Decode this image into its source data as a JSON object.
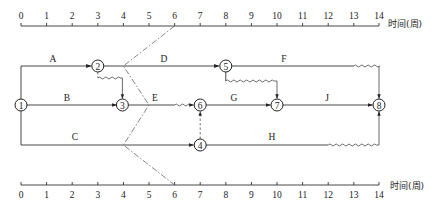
{
  "axis": {
    "unit_label": "时间(周)",
    "ticks": [
      "0",
      "1",
      "2",
      "3",
      "4",
      "5",
      "6",
      "7",
      "8",
      "9",
      "10",
      "11",
      "12",
      "13",
      "14"
    ],
    "min": 0,
    "max": 14
  },
  "nodes": [
    {
      "id": "1",
      "label": "1",
      "week": 0,
      "row": "middle"
    },
    {
      "id": "2",
      "label": "2",
      "week": 3,
      "row": "top"
    },
    {
      "id": "3",
      "label": "3",
      "week": 4,
      "row": "middle"
    },
    {
      "id": "4",
      "label": "4",
      "week": 7,
      "row": "bottom"
    },
    {
      "id": "5",
      "label": "5",
      "week": 8,
      "row": "top"
    },
    {
      "id": "6",
      "label": "6",
      "week": 7,
      "row": "middle"
    },
    {
      "id": "7",
      "label": "7",
      "week": 10,
      "row": "middle"
    },
    {
      "id": "8",
      "label": "8",
      "week": 14,
      "row": "middle"
    }
  ],
  "activities": [
    {
      "name": "A",
      "from": "1",
      "to": "2",
      "start": 0,
      "end": 3,
      "free_float": 0
    },
    {
      "name": "B",
      "from": "1",
      "to": "3",
      "start": 0,
      "end": 4,
      "free_float": 0
    },
    {
      "name": "C",
      "from": "1",
      "to": "4",
      "start": 0,
      "end": 7,
      "free_float": 0
    },
    {
      "name": "D",
      "from": "2",
      "to": "5",
      "start": 3,
      "end": 8,
      "free_float": 0
    },
    {
      "name": "E",
      "from": "3",
      "to": "6",
      "start": 4,
      "end": 6,
      "free_float": 1
    },
    {
      "name": "F",
      "from": "5",
      "to": "8",
      "start": 8,
      "end": 13,
      "free_float": 1
    },
    {
      "name": "G",
      "from": "6",
      "to": "7",
      "start": 7,
      "end": 10,
      "free_float": 0
    },
    {
      "name": "H",
      "from": "4",
      "to": "8",
      "start": 7,
      "end": 12,
      "free_float": 2
    },
    {
      "name": "J",
      "from": "7",
      "to": "8",
      "start": 10,
      "end": 14,
      "free_float": 0
    }
  ],
  "dummies": [
    {
      "from": "2",
      "to": "3",
      "wavy_weeks": [
        3,
        4
      ]
    },
    {
      "from": "5",
      "to": "7",
      "wavy_weeks": [
        8,
        10
      ]
    },
    {
      "from": "4",
      "to": "6",
      "dashed": true
    }
  ],
  "check_line": {
    "style": "dash-dot",
    "check_week": 6,
    "points": [
      {
        "row": "top-axis",
        "week": 6
      },
      {
        "row": "A",
        "week": 4
      },
      {
        "row": "E",
        "week": 5
      },
      {
        "row": "C",
        "week": 4
      },
      {
        "row": "bottom-axis",
        "week": 6
      }
    ]
  },
  "labels": {
    "A": "A",
    "B": "B",
    "C": "C",
    "D": "D",
    "E": "E",
    "F": "F",
    "G": "G",
    "H": "H",
    "J": "J"
  }
}
